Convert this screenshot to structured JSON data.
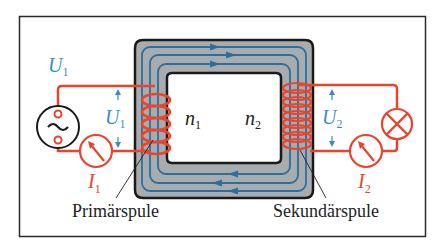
{
  "colors": {
    "frame": "#2a2a2a",
    "core_fill": "#a9acae",
    "core_outline": "#1a1a1a",
    "flux_line": "#2e6e9e",
    "circuit": "#e8452e",
    "voltage_label": "#3a8cc8",
    "current_label": "#e8452e",
    "source_outline": "#1a1a1a",
    "text": "#222222"
  },
  "labels": {
    "u1_source": "U",
    "u1_source_sub": "1",
    "u1_coil": "U",
    "u1_coil_sub": "1",
    "u2_coil": "U",
    "u2_coil_sub": "2",
    "i1": "I",
    "i1_sub": "1",
    "i2": "I",
    "i2_sub": "2",
    "n1": "n",
    "n1_sub": "1",
    "n2": "n",
    "n2_sub": "2",
    "primary_coil": "Primärspule",
    "secondary_coil": "Sekundärspule"
  },
  "components": {
    "source": {
      "name": "AC voltage source",
      "symbol": "~"
    },
    "ammeter_primary": {
      "name": "ammeter",
      "measures": "I1"
    },
    "ammeter_secondary": {
      "name": "ammeter",
      "measures": "I2"
    },
    "load": {
      "name": "lamp",
      "symbol": "⊗"
    },
    "primary_turns_drawn": 5,
    "secondary_turns_drawn": 9,
    "flux_direction": "clockwise"
  }
}
